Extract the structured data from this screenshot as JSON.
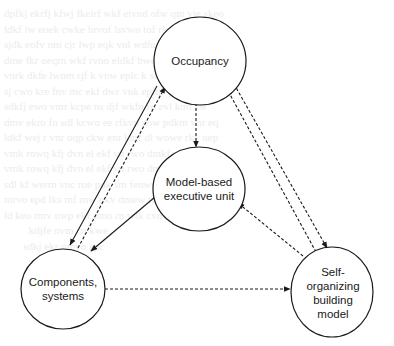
{
  "diagram": {
    "type": "cycle-flow",
    "nodes": [
      {
        "id": "occupancy",
        "label": "Occupancy",
        "cx": 200,
        "cy": 61,
        "rx": 46,
        "ry": 44
      },
      {
        "id": "model-based-executive-unit",
        "label": "Model-based\nexecutive unit",
        "cx": 199,
        "cy": 189,
        "rx": 46,
        "ry": 42
      },
      {
        "id": "components-systems",
        "label": "Components,\nsystems",
        "cx": 63,
        "cy": 289,
        "rx": 42,
        "ry": 40
      },
      {
        "id": "self-organizing-building-model",
        "label": "Self-\norganizing\nbuilding\nmodel",
        "cx": 332,
        "cy": 292,
        "rx": 41,
        "ry": 45
      }
    ],
    "edges": [
      {
        "from": "occupancy",
        "to": "components-systems",
        "style": "solid",
        "direction": "forward"
      },
      {
        "from": "components-systems",
        "to": "occupancy",
        "style": "dashed",
        "direction": "forward"
      },
      {
        "from": "occupancy",
        "to": "model-based-executive-unit",
        "style": "dashed",
        "direction": "both"
      },
      {
        "from": "model-based-executive-unit",
        "to": "components-systems",
        "style": "solid",
        "direction": "forward"
      },
      {
        "from": "self-organizing-building-model",
        "to": "model-based-executive-unit",
        "style": "dashed",
        "direction": "forward"
      },
      {
        "from": "occupancy",
        "to": "self-organizing-building-model",
        "style": "dashed",
        "direction": "forward"
      },
      {
        "from": "self-organizing-building-model",
        "to": "occupancy",
        "style": "dashed",
        "direction": "forward"
      },
      {
        "from": "components-systems",
        "to": "self-organizing-building-model",
        "style": "dashed",
        "direction": "forward"
      }
    ],
    "colors": {
      "stroke": "#1a1a1a",
      "fill": "#ffffff",
      "background": "#ffffff"
    }
  },
  "labels": {
    "occupancy": "Occupancy",
    "model_based": "Model-based\nexecutive unit",
    "components": "Components,\nsystems",
    "self_organizing": "Self-\norganizing\nbuilding\nmodel"
  }
}
